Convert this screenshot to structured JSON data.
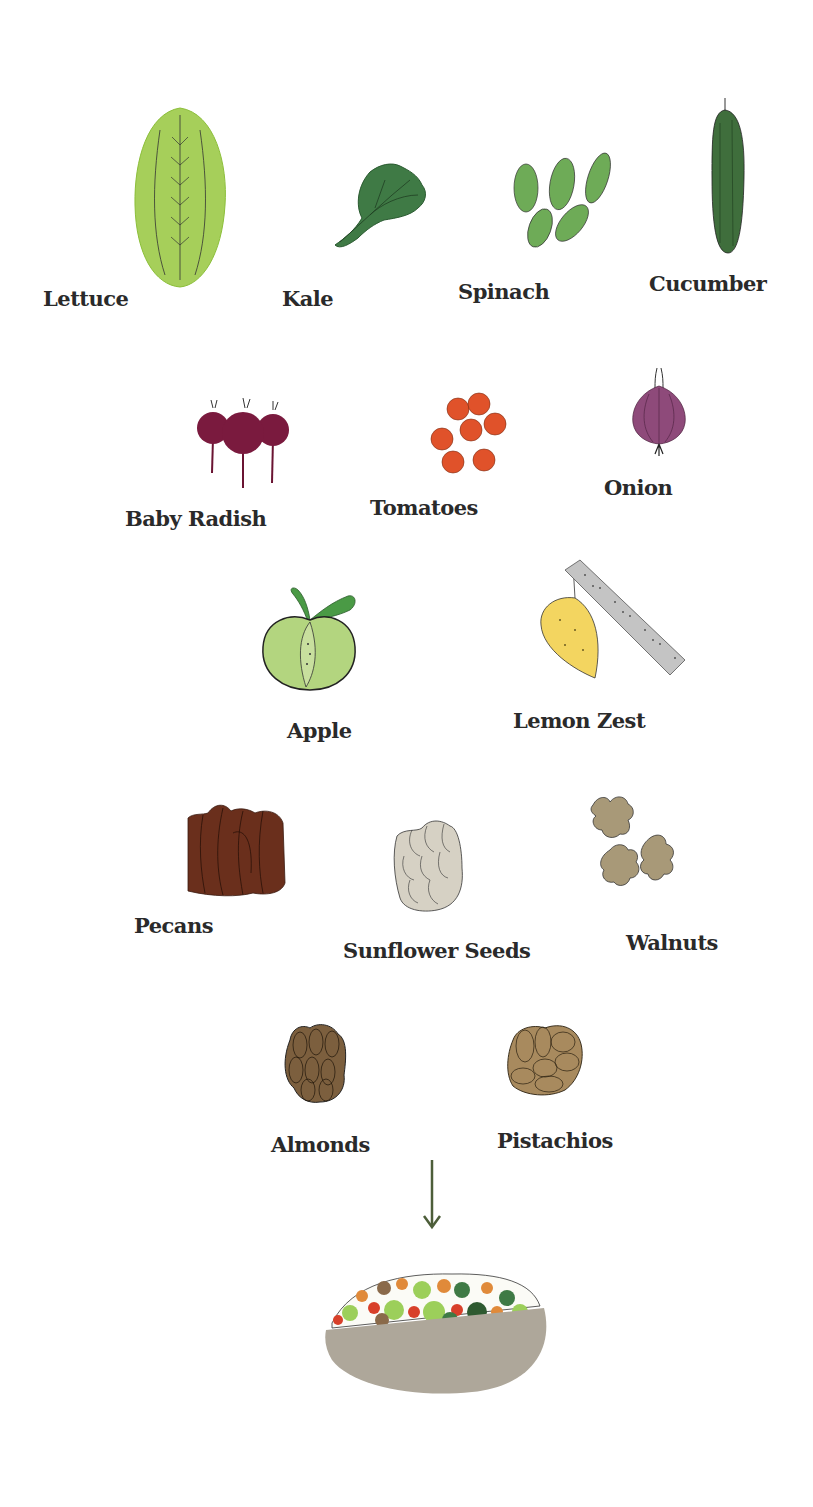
{
  "ingredients": [
    {
      "name": "Lettuce",
      "color": "#a6cf5a"
    },
    {
      "name": "Kale",
      "color": "#3f7a45"
    },
    {
      "name": "Spinach",
      "color": "#6eab57"
    },
    {
      "name": "Cucumber",
      "color": "#3f6e3c"
    },
    {
      "name": "Baby Radish",
      "color": "#7a1a3e"
    },
    {
      "name": "Tomatoes",
      "color": "#e0522a"
    },
    {
      "name": "Onion",
      "color": "#8e4a7a"
    },
    {
      "name": "Apple",
      "color": "#b3d57f"
    },
    {
      "name": "Lemon Zest",
      "color": "#f3d560"
    },
    {
      "name": "Pecans",
      "color": "#6a2f1c"
    },
    {
      "name": "Sunflower Seeds",
      "color": "#d6d1c4"
    },
    {
      "name": "Walnuts",
      "color": "#a89978"
    },
    {
      "name": "Almonds",
      "color": "#7c5f3e"
    },
    {
      "name": "Pistachios",
      "color": "#a88a5e"
    }
  ],
  "result": {
    "name": "salad bowl",
    "bowl_color": "#aea79a"
  },
  "arrow_color": "#4d5e3a"
}
